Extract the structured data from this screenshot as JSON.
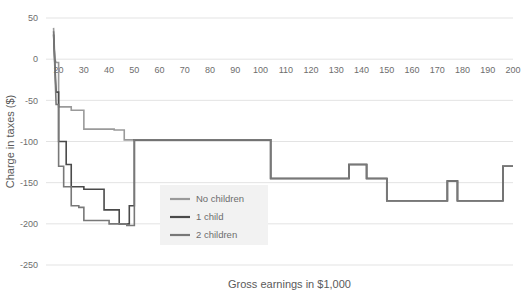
{
  "chart_data": {
    "type": "line",
    "title": "",
    "xlabel": "Gross earnings in $1,000",
    "ylabel": "Charge in taxes ($)",
    "xlim": [
      15,
      200
    ],
    "ylim": [
      -250,
      50
    ],
    "grid": true,
    "legend_position": "center-left-inside",
    "xticks": [
      20,
      30,
      40,
      50,
      60,
      70,
      80,
      90,
      100,
      110,
      120,
      130,
      140,
      150,
      160,
      170,
      180,
      190,
      200
    ],
    "yticks": [
      50,
      0,
      -50,
      -100,
      -150,
      -200,
      -250
    ],
    "series": [
      {
        "name": "No children",
        "color": "#9a9a9a",
        "points": [
          [
            18,
            38
          ],
          [
            18.5,
            0
          ],
          [
            19,
            -4
          ],
          [
            20,
            -4
          ],
          [
            20,
            -58
          ],
          [
            25,
            -58
          ],
          [
            25,
            -62
          ],
          [
            30,
            -62
          ],
          [
            30,
            -85
          ],
          [
            42,
            -85
          ],
          [
            42,
            -86
          ],
          [
            46,
            -86
          ],
          [
            46,
            -98
          ],
          [
            104,
            -98
          ],
          [
            104,
            -145
          ],
          [
            135,
            -145
          ],
          [
            135,
            -128
          ],
          [
            142,
            -128
          ],
          [
            142,
            -145
          ],
          [
            150,
            -145
          ],
          [
            150,
            -172
          ],
          [
            174,
            -172
          ],
          [
            174,
            -148
          ],
          [
            178,
            -148
          ],
          [
            178,
            -172
          ],
          [
            196,
            -172
          ],
          [
            196,
            -130
          ],
          [
            200,
            -130
          ]
        ]
      },
      {
        "name": "1 child",
        "color": "#4a4a4a",
        "points": [
          [
            18,
            30
          ],
          [
            19,
            -40
          ],
          [
            20,
            -40
          ],
          [
            20,
            -100
          ],
          [
            23,
            -100
          ],
          [
            23,
            -128
          ],
          [
            25,
            -128
          ],
          [
            25,
            -155
          ],
          [
            30,
            -155
          ],
          [
            30,
            -158
          ],
          [
            38,
            -158
          ],
          [
            38,
            -183
          ],
          [
            44,
            -183
          ],
          [
            44,
            -200
          ],
          [
            48,
            -200
          ],
          [
            48,
            -178
          ],
          [
            50,
            -178
          ],
          [
            50,
            -98
          ],
          [
            104,
            -98
          ],
          [
            104,
            -145
          ],
          [
            135,
            -145
          ],
          [
            135,
            -128
          ],
          [
            142,
            -128
          ],
          [
            142,
            -145
          ],
          [
            150,
            -145
          ],
          [
            150,
            -172
          ],
          [
            174,
            -172
          ],
          [
            174,
            -148
          ],
          [
            178,
            -148
          ],
          [
            178,
            -172
          ],
          [
            196,
            -172
          ],
          [
            196,
            -130
          ],
          [
            200,
            -130
          ]
        ]
      },
      {
        "name": "2 children",
        "color": "#787878",
        "points": [
          [
            18,
            34
          ],
          [
            19,
            -55
          ],
          [
            20,
            -55
          ],
          [
            20,
            -130
          ],
          [
            22,
            -130
          ],
          [
            22,
            -155
          ],
          [
            25,
            -155
          ],
          [
            25,
            -178
          ],
          [
            28,
            -178
          ],
          [
            28,
            -180
          ],
          [
            30,
            -180
          ],
          [
            30,
            -196
          ],
          [
            40,
            -196
          ],
          [
            40,
            -200
          ],
          [
            47,
            -200
          ],
          [
            47,
            -202
          ],
          [
            50,
            -202
          ],
          [
            50,
            -98
          ],
          [
            104,
            -98
          ],
          [
            104,
            -145
          ],
          [
            135,
            -145
          ],
          [
            135,
            -128
          ],
          [
            142,
            -128
          ],
          [
            142,
            -145
          ],
          [
            150,
            -145
          ],
          [
            150,
            -172
          ],
          [
            174,
            -172
          ],
          [
            174,
            -148
          ],
          [
            178,
            -148
          ],
          [
            178,
            -172
          ],
          [
            196,
            -172
          ],
          [
            196,
            -130
          ],
          [
            200,
            -130
          ]
        ]
      }
    ],
    "legend": [
      {
        "label": "No children",
        "color": "#9a9a9a"
      },
      {
        "label": "1 child",
        "color": "#4a4a4a"
      },
      {
        "label": "2 children",
        "color": "#787878"
      }
    ]
  }
}
